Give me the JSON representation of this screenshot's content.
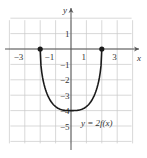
{
  "chart_data": {
    "type": "line",
    "title": "",
    "xlabel": "x",
    "ylabel": "y",
    "xlim": [
      -4,
      4
    ],
    "ylim": [
      -6,
      2
    ],
    "grid": true,
    "x_ticks": [
      -3,
      -1,
      1,
      3
    ],
    "x_tick_labels": [
      "−3",
      "−1",
      "1",
      "3"
    ],
    "y_ticks": [
      1,
      -1,
      -2,
      -3,
      -4,
      -5
    ],
    "y_tick_labels": [
      "1",
      "−1",
      "−2",
      "−3",
      "−4",
      "−5"
    ],
    "series": [
      {
        "name": "y = 2f(x)",
        "x": [
          -2,
          -1.5,
          -1,
          -0.5,
          0,
          0.5,
          1,
          1.5,
          2
        ],
        "y": [
          0,
          -2.2,
          -3.3,
          -3.85,
          -4,
          -3.85,
          -3.3,
          -2.2,
          0
        ],
        "endpoints": [
          [
            -2,
            0
          ],
          [
            2,
            0
          ]
        ],
        "color": "#1a1a1a"
      }
    ],
    "annotations": [
      {
        "text": "y = 2f(x)",
        "x": 1.9,
        "y": -4.6
      }
    ]
  },
  "colors": {
    "grid": "#c8c8c8",
    "axis": "#555555",
    "curve": "#1a1a1a"
  }
}
